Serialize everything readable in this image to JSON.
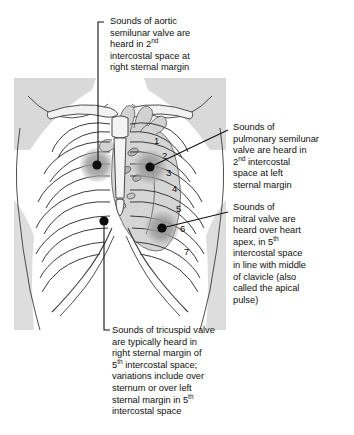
{
  "figure": {
    "illustration_name": "chest-ribcage-heart-illustration",
    "rib_numbers": [
      "1",
      "2",
      "3",
      "4",
      "5",
      "6",
      "7"
    ],
    "colors": {
      "line": "#1a1a1a",
      "rib_outline": "#4a4a4a",
      "skin_shade": "#d8d8d8",
      "heart_shade": "#cfcfcf",
      "point_halo": "#9a9a9a",
      "point_core": "#111111",
      "text": "#101010",
      "background": "#ffffff"
    },
    "points": [
      {
        "name": "aortic-point",
        "label": "aortic semilunar valve",
        "x": 97,
        "y": 165
      },
      {
        "name": "pulmonary-point",
        "label": "pulmonary semilunar valve",
        "x": 150,
        "y": 167
      },
      {
        "name": "mitral-point",
        "label": "mitral valve",
        "x": 162,
        "y": 228
      },
      {
        "name": "tricuspid-point",
        "label": "tricuspid valve",
        "x": 104,
        "y": 221
      }
    ]
  },
  "annotations": {
    "aortic": {
      "name": "aortic-annotation",
      "line1": "Sounds of aortic",
      "line2": "semilunar valve are",
      "line3_pre": "heard in 2",
      "line3_sup": "nd",
      "line4": "intercostal space at",
      "line5": "right sternal margin"
    },
    "pulmonary": {
      "name": "pulmonary-annotation",
      "line1": "Sounds of",
      "line2": "pulmonary semilunar",
      "line3": "valve are heard in",
      "line4_pre": "2",
      "line4_sup": "nd",
      "line4_post": " intercostal",
      "line5": "space at left",
      "line6": "sternal margin"
    },
    "mitral": {
      "name": "mitral-annotation",
      "line1": "Sounds of",
      "line2": "mitral valve are",
      "line3": "heard over heart",
      "line4_pre": "apex, in 5",
      "line4_sup": "th",
      "line5": "intercostal space",
      "line6": "in line with middle",
      "line7": "of clavicle (also",
      "line8": "called the apical",
      "line9": "pulse)"
    },
    "tricuspid": {
      "name": "tricuspid-annotation",
      "line1": "Sounds of tricuspid valve",
      "line2": "are typically heard in",
      "line3": "right sternal margin of",
      "line4_pre": "5",
      "line4_sup": "th",
      "line4_post": " intercostal space;",
      "line5": "variations include over",
      "line6": "sternum or over left",
      "line7_pre": "sternal margin in 5",
      "line7_sup": "th",
      "line8": "intercostal space"
    }
  }
}
